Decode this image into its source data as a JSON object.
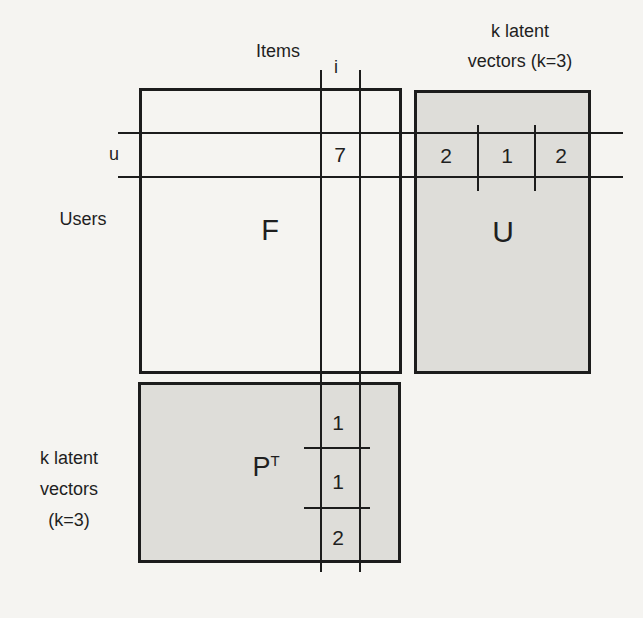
{
  "colors": {
    "background": "#f5f4f1",
    "line": "#1c1c1c",
    "matrix_fill": "#deddd9",
    "text": "#1f1f1f"
  },
  "labels": {
    "items_axis": "Items",
    "users_axis": "Users",
    "row_marker": "u",
    "col_marker": "i",
    "k_latent_top_line1": "k latent",
    "k_latent_top_line2": "vectors (k=3)",
    "k_latent_left_line1": "k latent",
    "k_latent_left_line2": "vectors",
    "k_latent_left_line3": "(k=3)"
  },
  "matrices": {
    "F": {
      "name": "F",
      "highlight_cell_value": "7"
    },
    "U": {
      "name": "U",
      "row_u_values": [
        "2",
        "1",
        "2"
      ]
    },
    "PT": {
      "name_base": "P",
      "name_sup": "T",
      "col_i_values": [
        "1",
        "1",
        "2"
      ]
    }
  }
}
